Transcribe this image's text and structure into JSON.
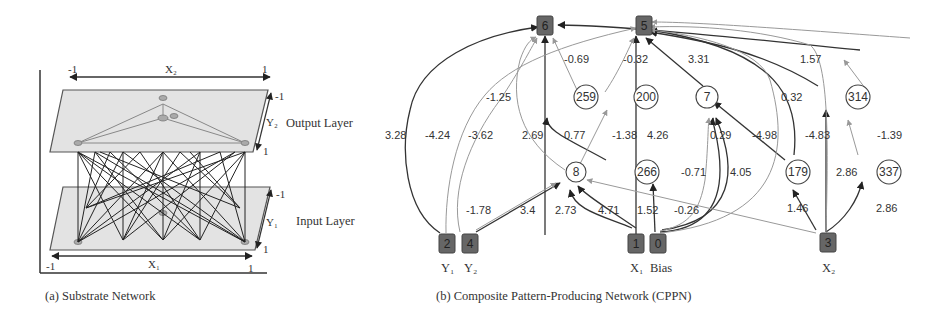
{
  "substrate": {
    "caption": "(a) Substrate Network",
    "x2_axis": {
      "label": "X₂",
      "min": "-1",
      "max": "1"
    },
    "x1_axis": {
      "label": "X₁",
      "min": "-1",
      "max": "1"
    },
    "y2_axis": {
      "label": "Y₂",
      "min": "-1",
      "max": "1"
    },
    "y1_axis": {
      "label": "Y₁",
      "min": "-1",
      "max": "1"
    },
    "output_layer_label": "Output Layer",
    "input_layer_label": "Input Layer"
  },
  "cppn": {
    "caption": "(b) Composite Pattern-Producing Network (CPPN)",
    "input_nodes": [
      {
        "id": "2",
        "label": "Y₁"
      },
      {
        "id": "4",
        "label": "Y₂"
      },
      {
        "id": "1",
        "label": "X₁"
      },
      {
        "id": "0",
        "label": "Bias"
      },
      {
        "id": "3",
        "label": "X₂"
      }
    ],
    "output_nodes": [
      {
        "id": "6"
      },
      {
        "id": "5"
      }
    ],
    "hidden_nodes": [
      {
        "id": "259"
      },
      {
        "id": "200"
      },
      {
        "id": "7"
      },
      {
        "id": "314"
      },
      {
        "id": "8"
      },
      {
        "id": "266"
      },
      {
        "id": "179"
      },
      {
        "id": "337"
      }
    ],
    "edge_weights": {
      "w_2_6": "3.28",
      "w_2_5": "-4.24",
      "w_4_5": "-3.62",
      "w_8_6": "-1.25",
      "w_1_6": "2.69",
      "w_259_6": "-0.69",
      "w_200_5": "-0.32",
      "w_7_5": "3.31",
      "w_314_6": "1.57",
      "w_266_259": "0.77",
      "w_8_200": "-1.38",
      "w_0_5": "4.26",
      "w_0_7a": "-0.71",
      "w_0_7b": "4.05",
      "w_179_7": "0.29",
      "w_179_5a": "-4.98",
      "w_179_5b": "0.32",
      "w_3_5": "-4.83",
      "w_3_314": "2.86",
      "w_337_314": "-1.39",
      "w_2_8": "-1.78",
      "w_4_8": "3.4",
      "w_1_8a": "2.73",
      "w_1_8b": "4.71",
      "w_0_266": "1.52",
      "w_3_8": "-0.26",
      "w_3_179": "1.46",
      "w_3_337": "2.86"
    }
  }
}
